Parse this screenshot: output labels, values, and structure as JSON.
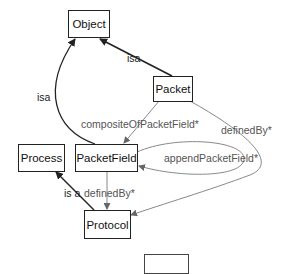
{
  "nodes": {
    "object": {
      "label": "Object"
    },
    "packet": {
      "label": "Packet"
    },
    "process": {
      "label": "Process"
    },
    "packet_field": {
      "label": "PacketField"
    },
    "protocol": {
      "label": "Protocol"
    },
    "unnamed": {
      "label": ""
    }
  },
  "edges": {
    "packet_isa_object": {
      "label": "isa",
      "from": "Packet",
      "to": "Object",
      "color": "#222222"
    },
    "packetfield_isa_object": {
      "label": "isa",
      "from": "PacketField",
      "to": "Object",
      "color": "#222222"
    },
    "packet_composite_packetfield": {
      "label": "compositeOfPacketField*",
      "from": "Packet",
      "to": "PacketField",
      "color": "#777777"
    },
    "packet_definedby_protocol": {
      "label": "definedBy*",
      "from": "Packet",
      "to": "Protocol",
      "color": "#777777"
    },
    "packetfield_append_self": {
      "label": "appendPacketField*",
      "from": "PacketField",
      "to": "PacketField",
      "color": "#777777"
    },
    "protocol_isa_process": {
      "label": "is a",
      "from": "Protocol",
      "to": "Process",
      "color": "#222222"
    },
    "packetfield_definedby_protocol": {
      "label": "definedBy*",
      "from": "PacketField",
      "to": "Protocol",
      "color": "#777777"
    }
  }
}
